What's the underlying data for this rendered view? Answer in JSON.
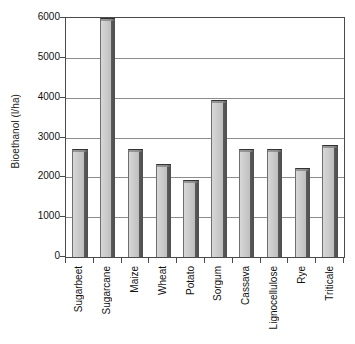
{
  "chart_data": {
    "type": "bar",
    "title": "",
    "xlabel": "",
    "ylabel": "Bioethanol (l/ha)",
    "ylim": [
      0,
      6000
    ],
    "yticks": [
      0,
      1000,
      2000,
      3000,
      4000,
      5000,
      6000
    ],
    "ytick_labels": [
      "0",
      "1000",
      "2000",
      "3000",
      "4000",
      "5000",
      "6000"
    ],
    "grid": "horizontal",
    "legend": "none",
    "categories": [
      "Sugarbeet",
      "Sugarcane",
      "Maize",
      "Wheat",
      "Potato",
      "Sorgum",
      "Cassava",
      "Lignocellulose",
      "Rye",
      "Triticale"
    ],
    "values": [
      2700,
      6000,
      2700,
      2330,
      1930,
      3950,
      2700,
      2700,
      2230,
      2800
    ],
    "bar_style": {
      "face_color": "#c6c6c6",
      "side_color": "#4e4e4e",
      "edge_color": "#333333"
    },
    "axis_color": "#4a4a4a",
    "grid_color": "#8c8c8c",
    "background_color": "#ffffff"
  }
}
